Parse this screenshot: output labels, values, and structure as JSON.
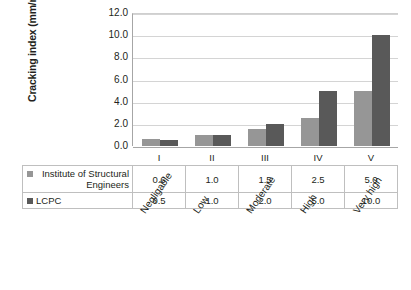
{
  "chart_data": {
    "type": "bar",
    "title": "",
    "subtitle": "",
    "xlabel": "",
    "ylabel": "Cracking index  (mm/m)",
    "ylim": [
      0,
      12
    ],
    "yticks": [
      "0.0",
      "2.0",
      "4.0",
      "6.0",
      "8.0",
      "10.0",
      "12.0"
    ],
    "grid": true,
    "legend_position": "table-left",
    "categories": [
      "I",
      "II",
      "III",
      "IV",
      "V"
    ],
    "category_descriptions": [
      "Negligable",
      "Low",
      "Moderate",
      "High",
      "Very high"
    ],
    "series": [
      {
        "name": "Institute of Structural Engineers",
        "color": "#969696",
        "values": [
          0.6,
          1.0,
          1.5,
          2.5,
          5.0
        ],
        "value_labels": [
          "0.6",
          "1.0",
          "1.5",
          "2.5",
          "5.0"
        ]
      },
      {
        "name": "LCPC",
        "color": "#595959",
        "values": [
          0.5,
          1.0,
          2.0,
          5.0,
          10.0
        ],
        "value_labels": [
          "0.5",
          "1.0",
          "2.0",
          "5.0",
          "10.0"
        ]
      }
    ]
  },
  "axis": {
    "y_title": "Cracking index  (mm/m)",
    "y_ticks": [
      "12.0",
      "10.0",
      "8.0",
      "6.0",
      "4.0",
      "2.0",
      "0.0"
    ]
  },
  "table": {
    "roman_headers": [
      "I",
      "II",
      "III",
      "IV",
      "V"
    ],
    "rows": [
      {
        "label": "Institute of Structural Engineers",
        "swatch": "#969696",
        "values": [
          "0.6",
          "1.0",
          "1.5",
          "2.5",
          "5.0"
        ]
      },
      {
        "label": "LCPC",
        "swatch": "#595959",
        "values": [
          "0.5",
          "1.0",
          "2.0",
          "5.0",
          "10.0"
        ]
      }
    ]
  },
  "category_labels": [
    "Negligable",
    "Low",
    "Moderate",
    "High",
    "Very high"
  ],
  "colors": {
    "series_light": "#969696",
    "series_dark": "#595959",
    "gridline": "#d4d4d4",
    "axis": "#a6a6a6",
    "table_border": "#bfbfbf",
    "text": "#231f20"
  }
}
